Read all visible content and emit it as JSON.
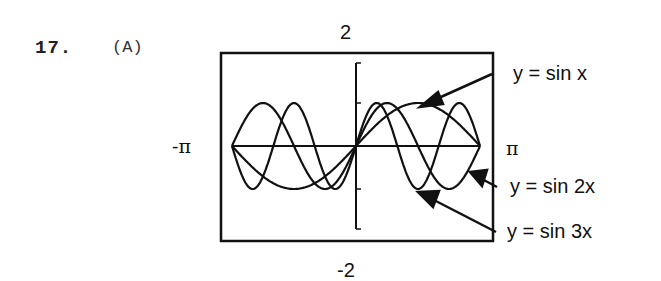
{
  "problem": {
    "number": "17.",
    "part": "(A)"
  },
  "window": {
    "ymax_label": "2",
    "ymin_label": "-2",
    "xmin_label": "-π",
    "xmax_label": "π"
  },
  "legend": [
    {
      "label": "y = sin x"
    },
    {
      "label": "y = sin 2x"
    },
    {
      "label": "y = sin 3x"
    }
  ],
  "chart_data": {
    "type": "line",
    "title": "",
    "xlabel": "",
    "ylabel": "",
    "xlim": [
      -3.14159,
      3.14159
    ],
    "ylim": [
      -2,
      2
    ],
    "x_tick_labels": [
      "-π",
      "π"
    ],
    "y_tick_labels": [
      "-2",
      "2"
    ],
    "y_ticks_marked": [
      -2,
      -1,
      1,
      2
    ],
    "grid": false,
    "series": [
      {
        "name": "y = sin x",
        "function": "sin(x)",
        "x": [
          -3.1416,
          -2.3562,
          -1.5708,
          -0.7854,
          0,
          0.7854,
          1.5708,
          2.3562,
          3.1416
        ],
        "values": [
          0,
          -0.707,
          -1,
          -0.707,
          0,
          0.707,
          1,
          0.707,
          0
        ]
      },
      {
        "name": "y = sin 2x",
        "function": "sin(2x)",
        "x": [
          -3.1416,
          -2.3562,
          -1.5708,
          -0.7854,
          0,
          0.7854,
          1.5708,
          2.3562,
          3.1416
        ],
        "values": [
          0,
          1,
          0,
          -1,
          0,
          1,
          0,
          -1,
          0
        ]
      },
      {
        "name": "y = sin 3x",
        "function": "sin(3x)",
        "x": [
          -3.1416,
          -2.618,
          -2.0944,
          -1.5708,
          -1.0472,
          -0.5236,
          0,
          0.5236,
          1.0472,
          1.5708,
          2.0944,
          2.618,
          3.1416
        ],
        "values": [
          0,
          -1,
          0,
          1,
          0,
          -1,
          0,
          1,
          0,
          -1,
          0,
          1,
          0
        ]
      }
    ],
    "legend_position": "right, with arrows"
  }
}
